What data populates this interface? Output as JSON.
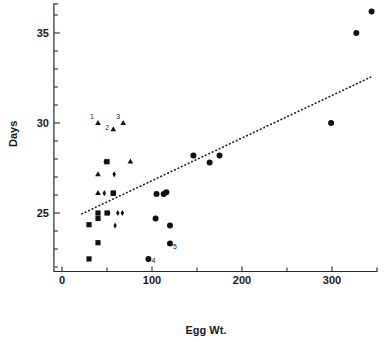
{
  "chart_data": {
    "type": "scatter",
    "title": "",
    "xlabel": "Egg  Wt.",
    "ylabel": "Days",
    "xlim": [
      -10,
      350
    ],
    "ylim": [
      22.0,
      36.6
    ],
    "grid": false,
    "legend_position": "none",
    "x_ticks_major": [
      0,
      100,
      200,
      300
    ],
    "x_tick_labels": [
      "0",
      "100",
      "200",
      "300"
    ],
    "x_ticks_minor": [
      50,
      150,
      250
    ],
    "y_ticks_major": [
      25,
      30,
      35
    ],
    "y_tick_labels": [
      "25",
      "30",
      "35"
    ],
    "y_ticks_minor": [
      23,
      24,
      26,
      27,
      28,
      29,
      31,
      32,
      33,
      34,
      36
    ],
    "series": [
      {
        "name": "squares",
        "marker": "square",
        "points": [
          {
            "x": 30,
            "y": 24.35
          },
          {
            "x": 30,
            "y": 22.45
          },
          {
            "x": 40,
            "y": 25.0
          },
          {
            "x": 40,
            "y": 24.7
          },
          {
            "x": 40,
            "y": 23.35
          },
          {
            "x": 50,
            "y": 27.85
          },
          {
            "x": 50,
            "y": 25.0
          },
          {
            "x": 57,
            "y": 26.1
          },
          {
            "x": 57,
            "y": 26.1
          }
        ]
      },
      {
        "name": "triangles",
        "marker": "triangle",
        "points": [
          {
            "x": 40,
            "y": 30.0,
            "label": "1"
          },
          {
            "x": 57,
            "y": 29.65,
            "label": "2"
          },
          {
            "x": 68,
            "y": 30.0,
            "label": "3"
          },
          {
            "x": 40,
            "y": 27.15
          },
          {
            "x": 40,
            "y": 26.1
          },
          {
            "x": 76,
            "y": 27.85
          }
        ]
      },
      {
        "name": "diamonds",
        "marker": "diamond",
        "points": [
          {
            "x": 48,
            "y": 27.85
          },
          {
            "x": 58,
            "y": 27.15
          },
          {
            "x": 47,
            "y": 26.1
          },
          {
            "x": 52,
            "y": 25.0
          },
          {
            "x": 62,
            "y": 25.0
          },
          {
            "x": 67,
            "y": 25.0
          },
          {
            "x": 59,
            "y": 24.3
          }
        ]
      },
      {
        "name": "circles",
        "marker": "circle",
        "points": [
          {
            "x": 105,
            "y": 26.05
          },
          {
            "x": 113,
            "y": 26.05
          },
          {
            "x": 116,
            "y": 26.15
          },
          {
            "x": 104,
            "y": 24.7
          },
          {
            "x": 120,
            "y": 24.3
          },
          {
            "x": 120,
            "y": 23.3,
            "label": "5"
          },
          {
            "x": 96,
            "y": 22.45,
            "label": "4"
          },
          {
            "x": 146,
            "y": 28.2
          },
          {
            "x": 164,
            "y": 27.8
          },
          {
            "x": 175,
            "y": 28.2
          },
          {
            "x": 299,
            "y": 30.0
          },
          {
            "x": 327,
            "y": 35.0
          },
          {
            "x": 344,
            "y": 36.2
          }
        ]
      }
    ],
    "trendline": {
      "type": "dotted-linear",
      "x_start": 22,
      "y_start": 24.95,
      "x_end": 343,
      "y_end": 32.55
    },
    "annotations": [
      {
        "text": "1",
        "x": 40,
        "y": 30.0
      },
      {
        "text": "2",
        "x": 57,
        "y": 29.65
      },
      {
        "text": "3",
        "x": 68,
        "y": 30.0
      },
      {
        "text": "4",
        "x": 96,
        "y": 22.45
      },
      {
        "text": "5",
        "x": 120,
        "y": 23.3
      }
    ]
  },
  "colors": {
    "marker": "#111111",
    "axis": "#2b2b2b",
    "text": "#1a1a1a",
    "background": "#ffffff"
  }
}
